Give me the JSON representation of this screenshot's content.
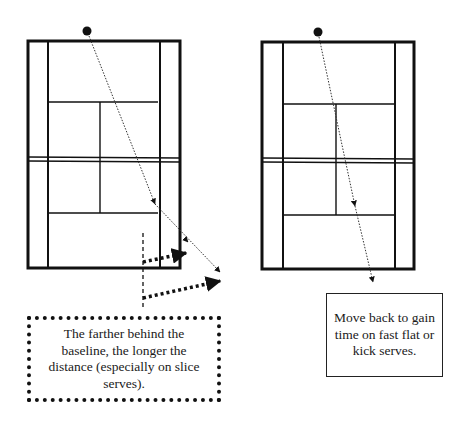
{
  "diagram": {
    "left_panel": {
      "description": "Court with serve angled wide toward the deuce sideline; returner moving diagonally back",
      "note": "The farther behind the baseline, the longer the distance (especially on slice serves).",
      "note_border": "dotted"
    },
    "right_panel": {
      "description": "Court with serve down the middle; returner moving straight back",
      "note": "Move back to gain time on fast flat or kick serves.",
      "note_border": "solid"
    },
    "colors": {
      "lines": "#111111",
      "background": "#ffffff"
    }
  }
}
